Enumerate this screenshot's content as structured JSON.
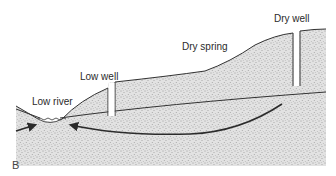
{
  "figure": {
    "panel_label": "B",
    "labels": {
      "low_river": "Low river",
      "low_well": "Low well",
      "dry_spring": "Dry spring",
      "dry_well": "Dry well"
    },
    "colors": {
      "ground_fill": "#d9d9d9",
      "stipple": "#555555",
      "line": "#333333",
      "background": "#ffffff"
    }
  }
}
